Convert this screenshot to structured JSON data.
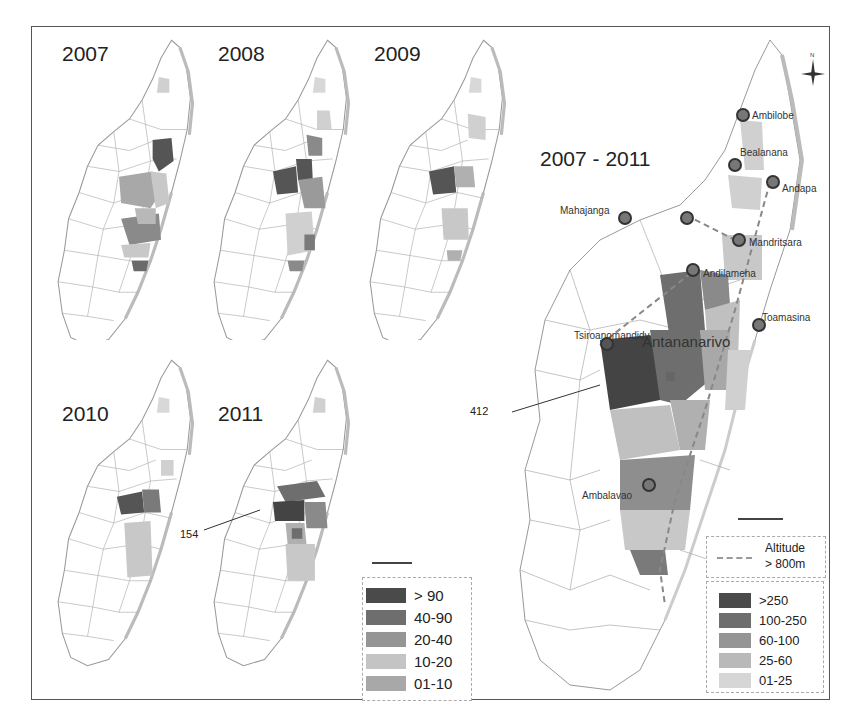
{
  "figure": {
    "small_maps": [
      {
        "year": "2007"
      },
      {
        "year": "2008"
      },
      {
        "year": "2009"
      },
      {
        "year": "2010"
      },
      {
        "year": "2011"
      }
    ],
    "big_map": {
      "title": "2007 - 2011",
      "annotation_value": "412",
      "cities": [
        {
          "name": "Ambilobe"
        },
        {
          "name": "Bealanana"
        },
        {
          "name": "Andapa"
        },
        {
          "name": "Mahajanga"
        },
        {
          "name": "Mandritsara"
        },
        {
          "name": "Andilamena"
        },
        {
          "name": "Toamasina"
        },
        {
          "name": "Tsiroanomandidy"
        },
        {
          "name": "Antananarivo"
        },
        {
          "name": "Ambalavao"
        }
      ],
      "altitude_legend": {
        "line1": "Altitude",
        "line2": "> 800m"
      },
      "legend": [
        {
          "label": ">250",
          "color": "#4a4a4a"
        },
        {
          "label": "100-250",
          "color": "#6e6e6e"
        },
        {
          "label": "60-100",
          "color": "#959595"
        },
        {
          "label": "25-60",
          "color": "#b9b9b9"
        },
        {
          "label": "01-25",
          "color": "#d6d6d6"
        }
      ],
      "scale": {
        "ticks": [
          "0",
          "50",
          "100"
        ],
        "unit": "Km"
      },
      "north": "N"
    },
    "small_annotation_value": "154",
    "small_legend": [
      {
        "label": "> 90",
        "color": "#4a4a4a"
      },
      {
        "label": "40-90",
        "color": "#6e6e6e"
      },
      {
        "label": "20-40",
        "color": "#959595"
      },
      {
        "label": "10-20",
        "color": "#c4c4c4"
      },
      {
        "label": "01-10",
        "color": "#a8a8a8"
      }
    ],
    "small_scale": {
      "ticks": [
        "0",
        "100",
        "200"
      ],
      "unit": "Km"
    }
  }
}
